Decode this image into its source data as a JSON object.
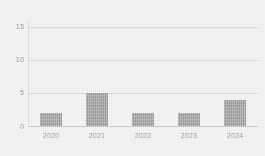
{
  "chart_data": {
    "type": "bar",
    "title": "",
    "subtitle": "",
    "xlabel": "",
    "ylabel": "",
    "categories": [
      "2020",
      "2021",
      "2022",
      "2023",
      "2024"
    ],
    "values": [
      2,
      5,
      2,
      2,
      4
    ],
    "ylim": [
      0,
      16
    ],
    "yticks": [
      0,
      5,
      10,
      15
    ],
    "ytick_labels": [
      "0",
      "5",
      "10",
      "15"
    ],
    "grid": true,
    "grid_axis": "y",
    "legend": false,
    "legend_position": "none",
    "series": [
      {
        "name": "",
        "values": [
          2,
          5,
          2,
          2,
          4
        ]
      }
    ]
  },
  "style": {
    "background_color": "#efefee",
    "bar_color": "#9a9a9a",
    "gridline_color": "#d2d2d0",
    "baseline_color": "#c2c2c0",
    "axis_line_color": "#d6d6d4",
    "tick_label_color": "#8d8d8b"
  }
}
